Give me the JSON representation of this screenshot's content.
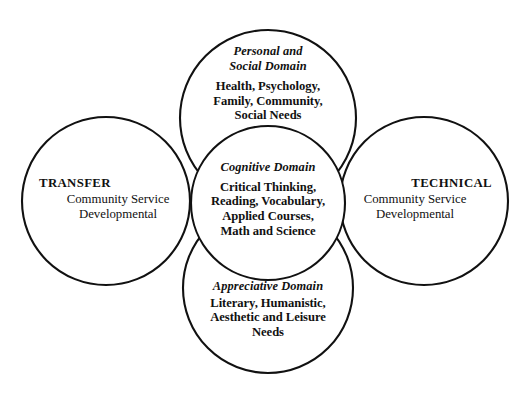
{
  "diagram": {
    "background_color": "#ffffff",
    "stroke_color": "#111111",
    "text_color": "#111111"
  },
  "circles": {
    "top": {
      "name": "personal-social-domain",
      "cx": 268,
      "cy": 118,
      "r": 88,
      "heading_line1": "Personal and",
      "heading_line2": "Social Domain",
      "body_line1": "Health, Psychology,",
      "body_line2": "Family, Community,",
      "body_line3": "Social Needs"
    },
    "center": {
      "name": "cognitive-domain",
      "cx": 268,
      "cy": 203,
      "r": 77,
      "heading_line1": "Cognitive Domain",
      "body_line1": "Critical Thinking,",
      "body_line2": "Reading, Vocabulary,",
      "body_line3": "Applied Courses,",
      "body_line4": "Math and Science"
    },
    "bottom": {
      "name": "appreciative-domain",
      "cx": 268,
      "cy": 288,
      "r": 85,
      "heading_line1": "Appreciative Domain",
      "body_line1": "Literary, Humanistic,",
      "body_line2": "Aesthetic and Leisure",
      "body_line3": "Needs"
    },
    "left": {
      "name": "transfer-track",
      "cx": 106,
      "cy": 201,
      "r": 84,
      "heading": "TRANSFER",
      "line1": "Community Service",
      "line2": "Developmental"
    },
    "right": {
      "name": "technical-track",
      "cx": 424,
      "cy": 201,
      "r": 84,
      "heading": "TECHNICAL",
      "line1": "Community Service",
      "line2": "Developmental"
    }
  }
}
